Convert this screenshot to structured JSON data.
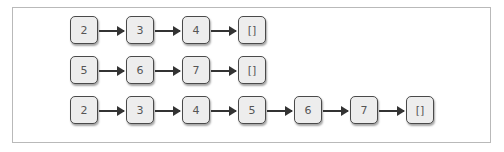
{
  "diagram": {
    "type": "linked-list concatenation",
    "rows": [
      {
        "id": "list-a",
        "nodes": [
          "2",
          "3",
          "4",
          "[]"
        ]
      },
      {
        "id": "list-b",
        "nodes": [
          "5",
          "6",
          "7",
          "[]"
        ]
      },
      {
        "id": "list-concat",
        "nodes": [
          "2",
          "3",
          "4",
          "5",
          "6",
          "7",
          "[]"
        ]
      }
    ],
    "colors": {
      "node_fill": "#ededed",
      "node_border": "#4a4a4a",
      "arrow": "#333333",
      "frame_border": "#b9b9b9"
    }
  }
}
